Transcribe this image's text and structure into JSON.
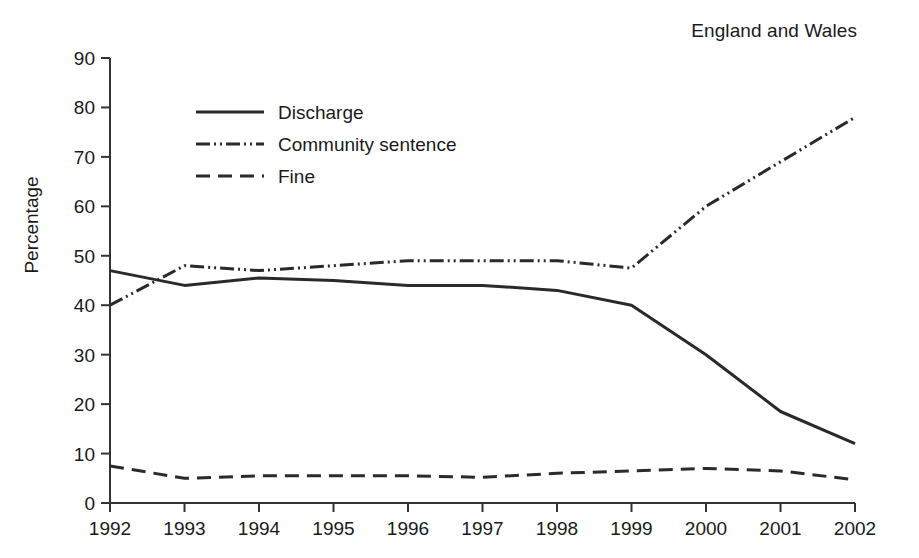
{
  "figure": {
    "region_label": "England and Wales",
    "y_axis_label": "Percentage"
  },
  "chart_data": {
    "type": "line",
    "title": "",
    "subtitle": "England and Wales",
    "xlabel": "",
    "ylabel": "Percentage",
    "x": [
      1992,
      1993,
      1994,
      1995,
      1996,
      1997,
      1998,
      1999,
      2000,
      2001,
      2002
    ],
    "xtick_labels": [
      "1992",
      "1993",
      "1994",
      "1995",
      "1996",
      "1997",
      "1998",
      "1999",
      "2000",
      "2001",
      "2002"
    ],
    "ytick_labels": [
      "0",
      "10",
      "20",
      "30",
      "40",
      "50",
      "60",
      "70",
      "80",
      "90"
    ],
    "yticks": [
      0,
      10,
      20,
      30,
      40,
      50,
      60,
      70,
      80,
      90
    ],
    "xlim": [
      1992,
      2002
    ],
    "ylim": [
      0,
      90
    ],
    "grid": false,
    "legend_position": "upper-left-inside",
    "series": [
      {
        "name": "Discharge",
        "style": "solid",
        "dasharray": "",
        "color": "#2a2a2a",
        "values": [
          47,
          44,
          45.5,
          45,
          44,
          44,
          43,
          40,
          30,
          18.5,
          12
        ]
      },
      {
        "name": "Community sentence",
        "style": "dash-dot-dot",
        "dasharray": "14,4,2,4,2,4",
        "color": "#2a2a2a",
        "values": [
          40,
          48,
          47,
          48,
          49,
          49,
          49,
          47.5,
          60,
          69,
          78
        ]
      },
      {
        "name": "Fine",
        "style": "dashed",
        "dasharray": "14,8",
        "color": "#2a2a2a",
        "values": [
          7.5,
          5,
          5.5,
          5.5,
          5.5,
          5.2,
          6,
          6.5,
          7,
          6.5,
          4.7
        ]
      }
    ]
  }
}
